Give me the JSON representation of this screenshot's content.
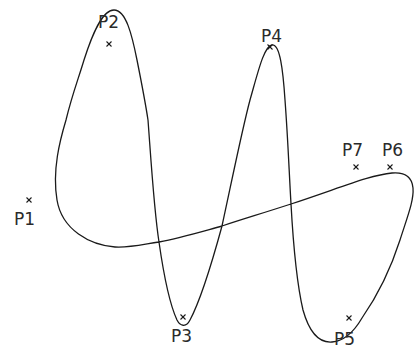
{
  "diagram": {
    "type": "spline-through-control-points",
    "stroke_color": "#1a1a1a",
    "background": "#ffffff",
    "points": [
      {
        "id": "P1",
        "label": "P1",
        "marker": [
          29,
          200
        ],
        "label_pos": [
          14,
          225
        ]
      },
      {
        "id": "P2",
        "label": "P2",
        "marker": [
          109,
          44
        ],
        "label_pos": [
          98,
          27
        ]
      },
      {
        "id": "P3",
        "label": "P3",
        "marker": [
          183,
          317
        ],
        "label_pos": [
          171,
          342
        ]
      },
      {
        "id": "P4",
        "label": "P4",
        "marker": [
          270,
          47
        ],
        "label_pos": [
          261,
          42
        ]
      },
      {
        "id": "P5",
        "label": "P5",
        "marker": [
          349,
          318
        ],
        "label_pos": [
          334,
          345
        ]
      },
      {
        "id": "P6",
        "label": "P6",
        "marker": [
          390,
          167
        ],
        "label_pos": [
          382,
          156
        ]
      },
      {
        "id": "P7",
        "label": "P7",
        "marker": [
          356,
          167
        ],
        "label_pos": [
          342,
          156
        ]
      }
    ],
    "curve_path": "M115,247 C90,245 62,230 57,200 C52,170 60,140 66,120 C72,95 78,80 84,60 C92,35 102,10 114,10 C126,10 132,35 137,60 C142,85 145,100 148,120 C151,160 154,210 159,242 C163,270 170,305 177,320 C180,326 186,328 190,320 C198,305 210,270 222,226 C232,180 242,130 250,100 C258,72 264,46 272,45 C280,44 283,70 285,100 C288,140 289,170 291,204 C293,240 296,280 303,310 C310,335 320,343 332,342 C345,341 355,330 362,318 C378,295 392,265 400,240 C408,215 414,200 413,188 C412,176 404,172 392,173 C370,175 340,188 291,204 C260,214 240,220 222,226 C200,232 180,238 159,242 C140,245 128,248 115,247 Z"
  }
}
